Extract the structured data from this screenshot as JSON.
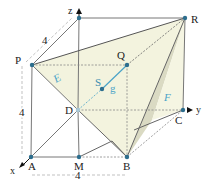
{
  "diagram": {
    "type": "3d-cube-geometry",
    "cube_side": "4",
    "axes": {
      "x": "x",
      "y": "y",
      "z": "z"
    },
    "points": {
      "P": "P",
      "Q": "Q",
      "R": "R",
      "S": "S",
      "D": "D",
      "C": "C",
      "A": "A",
      "M": "M",
      "B": "B"
    },
    "planes": {
      "E": "E",
      "F": "F"
    },
    "line": {
      "g": "g"
    },
    "dimensions": {
      "top": "4",
      "left": "4",
      "bottom": "4"
    },
    "colors": {
      "edge": "#666666",
      "point": "#2d6e8e",
      "plane_fill": "#f0f0d8",
      "plane_shadow": "#d8d8c0",
      "line_g": "#4aa3c8",
      "label_blue": "#4aa3c8"
    }
  }
}
